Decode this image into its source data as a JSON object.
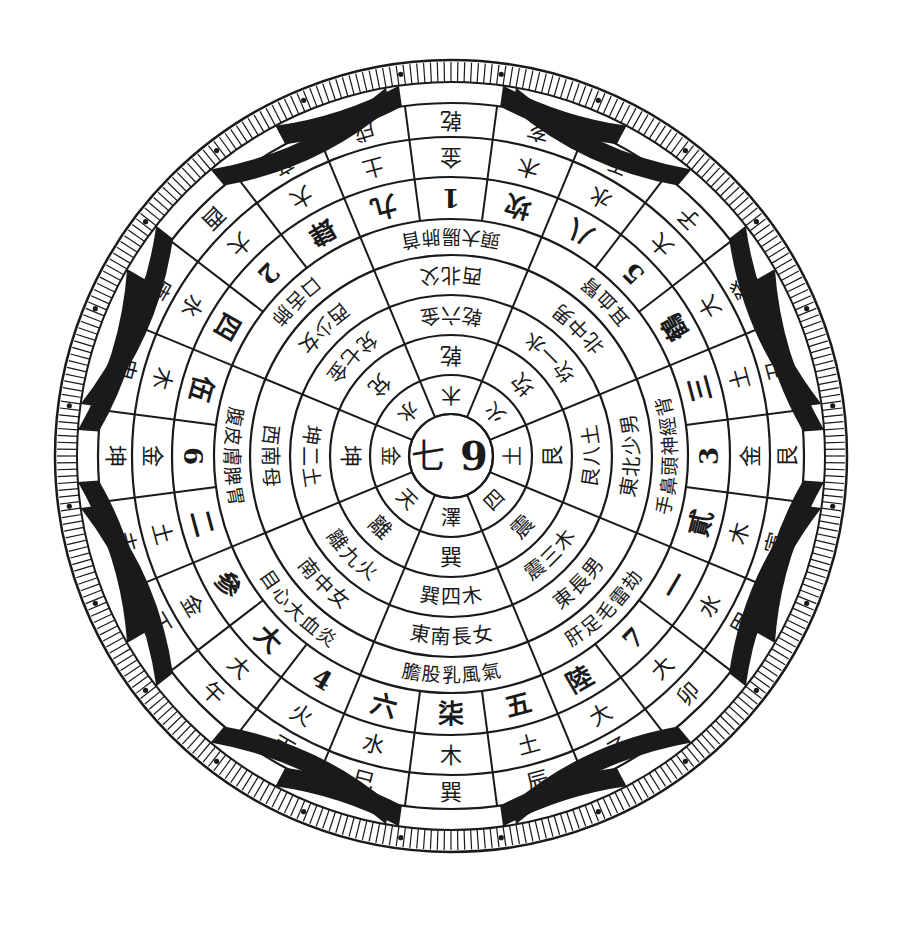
{
  "diagram": {
    "colors": {
      "ink": "#1a1a1a",
      "paper": "#ffffff"
    },
    "geometry": {
      "cx": 451,
      "cy": 456,
      "outer_r": 396
    },
    "center": {
      "left": "七",
      "right": "9"
    },
    "trigram_ring": [
      "兌",
      "乾",
      "坎",
      "艮",
      "震",
      "離",
      "坤",
      "巽"
    ],
    "element_ring_inner": [
      "澤 火",
      "天 水",
      "金 西",
      "水 木",
      "木 雷",
      "火 金",
      "土 二",
      "四 木"
    ],
    "direction_ring_inner": [
      "兌 七 金",
      "乾 六 金",
      "坎 一 水",
      "艮 八 土",
      "震 三 木",
      "離 九 火",
      "坤 二 土",
      "巽 四 木"
    ],
    "family_ring": [
      "西 少 女",
      "西 北 父",
      "北 中 男",
      "東 北 少 男",
      "東 長 男",
      "南 中 女",
      "西 南 母",
      "東 南 長 女"
    ],
    "body_ring": [
      "口 舌 肺",
      "頭 大腸 肺 首",
      "耳 血 腎",
      "手 鼻 頭 神經 背",
      "肝 足 毛 雷 劫",
      "目 心 大 血 炎",
      "腹 皮 膚 脾 胃",
      "膽 股 乳 風 氣"
    ],
    "mountains_24": {
      "numbers": [
        "柒",
        "六",
        "4",
        "大",
        "參",
        "二",
        "伍",
        "四",
        "2",
        "肆",
        "九",
        "1",
        "坎",
        "八",
        "5",
        "陸",
        "三",
        "3",
        "貳",
        "一",
        "7",
        "陸",
        "五",
        "8"
      ],
      "elements": [
        "木",
        "水",
        "火",
        "火",
        "火",
        "土",
        "土",
        "木",
        "水",
        "火",
        "火",
        "土",
        "金",
        "木",
        "水",
        "火",
        "火",
        "土",
        "金",
        "木",
        "水",
        "火",
        "火",
        "土",
        "金"
      ],
      "labels": [
        "巽",
        "巳",
        "丙",
        "午",
        "丁",
        "未",
        "坤",
        "申",
        "庚",
        "酉",
        "辛",
        "戌",
        "乾",
        "亥",
        "壬",
        "子",
        "癸",
        "丑",
        "艮",
        "寅",
        "甲",
        "卯",
        "乙",
        "辰"
      ]
    },
    "ring_24_inner_numbers": [
      "柒",
      "六",
      "4",
      "大",
      "參",
      "二",
      "6",
      "伍",
      "四",
      "2",
      "肆",
      "九",
      "1",
      "坎",
      "八",
      "5",
      "鶴",
      "三",
      "3",
      "貳",
      "一",
      "7",
      "陸",
      "五",
      "8"
    ],
    "ring_24_elements": [
      "木",
      "水",
      "火",
      "大",
      "金",
      "土",
      "金",
      "木",
      "水",
      "大",
      "大",
      "土",
      "金",
      "木",
      "水",
      "大",
      "大",
      "土",
      "金",
      "木",
      "水",
      "大",
      "大",
      "土",
      "金"
    ],
    "ring_24_labels": [
      "巽",
      "巳",
      "丙",
      "午",
      "丁",
      "未",
      "坤",
      "申",
      "庚",
      "酉",
      "辛",
      "戌",
      "乾",
      "亥",
      "壬",
      "子",
      "癸",
      "丑",
      "艮",
      "寅",
      "甲",
      "卯",
      "乙",
      "辰"
    ],
    "dark_band_segments": [
      [
        -86,
        -60
      ],
      [
        -40,
        -10
      ],
      [
        10,
        40
      ],
      [
        60,
        86
      ],
      [
        94,
        120
      ],
      [
        140,
        170
      ],
      [
        190,
        220
      ],
      [
        240,
        266
      ]
    ],
    "tick_count": 360
  }
}
